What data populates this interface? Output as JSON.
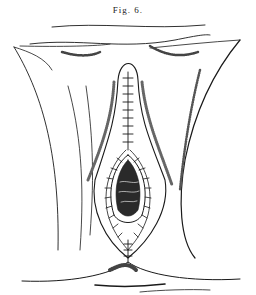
{
  "figure": {
    "caption": "Fig. 6.",
    "colors": {
      "ink": "#1a1a1a",
      "paper": "#ffffff",
      "shade": "#555555"
    }
  }
}
